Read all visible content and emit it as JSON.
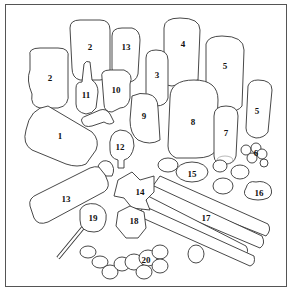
{
  "figure": {
    "labels": [
      {
        "id": "label-2a",
        "text": "2",
        "x": 50,
        "y": 78
      },
      {
        "id": "label-2b",
        "text": "2",
        "x": 90,
        "y": 47
      },
      {
        "id": "label-13a",
        "text": "13",
        "x": 126,
        "y": 47
      },
      {
        "id": "label-4",
        "text": "4",
        "x": 183,
        "y": 44
      },
      {
        "id": "label-3",
        "text": "3",
        "x": 157,
        "y": 75
      },
      {
        "id": "label-5a",
        "text": "5",
        "x": 225,
        "y": 66
      },
      {
        "id": "label-5b",
        "text": "5",
        "x": 257,
        "y": 111
      },
      {
        "id": "label-11",
        "text": "11",
        "x": 86,
        "y": 95
      },
      {
        "id": "label-10",
        "text": "10",
        "x": 116,
        "y": 90
      },
      {
        "id": "label-9",
        "text": "9",
        "x": 144,
        "y": 116
      },
      {
        "id": "label-8",
        "text": "8",
        "x": 193,
        "y": 122
      },
      {
        "id": "label-7",
        "text": "7",
        "x": 226,
        "y": 133
      },
      {
        "id": "label-6",
        "text": "6",
        "x": 256,
        "y": 153
      },
      {
        "id": "label-1",
        "text": "1",
        "x": 60,
        "y": 136
      },
      {
        "id": "label-12",
        "text": "12",
        "x": 120,
        "y": 147
      },
      {
        "id": "label-15",
        "text": "15",
        "x": 192,
        "y": 174
      },
      {
        "id": "label-16",
        "text": "16",
        "x": 259,
        "y": 193
      },
      {
        "id": "label-14",
        "text": "14",
        "x": 140,
        "y": 192
      },
      {
        "id": "label-13b",
        "text": "13",
        "x": 66,
        "y": 199
      },
      {
        "id": "label-17",
        "text": "17",
        "x": 206,
        "y": 218
      },
      {
        "id": "label-19",
        "text": "19",
        "x": 93,
        "y": 218
      },
      {
        "id": "label-18",
        "text": "18",
        "x": 134,
        "y": 221
      },
      {
        "id": "label-20",
        "text": "20",
        "x": 146,
        "y": 260
      }
    ]
  }
}
